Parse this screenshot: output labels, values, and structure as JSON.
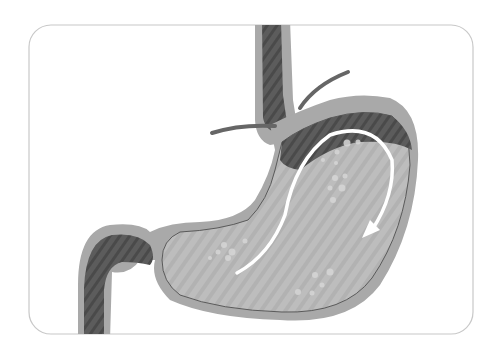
{
  "image": {
    "subject": "stomach-anatomy-illustration",
    "description": "Grayscale cross-section illustration of esophagus, stomach and duodenum with a white curved arrow showing the direction of flow",
    "colors": {
      "background": "#ffffff",
      "frame_border": "#c8c8c8",
      "outer_wall": "#a9a9a9",
      "dark_lumen": "#5a5a5a",
      "stomach_content": "#bdbdbd",
      "gas_pocket": "#4e4e4e",
      "bubbles": "#d6d6d6",
      "diaphragm": "#666666",
      "arrow": "#ffffff"
    }
  }
}
